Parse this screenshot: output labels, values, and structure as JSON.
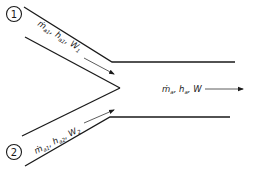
{
  "diagram": {
    "title": "",
    "type": "adiabatic mixing of two moist air streams",
    "inlets": [
      {
        "id": "inlet-1",
        "marker": "1",
        "label_parts": {
          "mdot": "ṁ",
          "mdot_sub": "a1",
          "h": "h",
          "h_sub": "a1",
          "w": "W",
          "w_sub": "1"
        }
      },
      {
        "id": "inlet-2",
        "marker": "2",
        "label_parts": {
          "mdot": "ṁ",
          "mdot_sub": "a1",
          "h": "h",
          "h_sub": "a2",
          "w": "W",
          "w_sub": "2"
        }
      }
    ],
    "outlet": {
      "id": "outlet",
      "label_parts": {
        "mdot": "ṁ",
        "mdot_sub": "a",
        "h": "h",
        "h_sub": "a",
        "w": "W"
      }
    },
    "colors": {
      "line": "#1a1a1a",
      "background": "#ffffff"
    }
  }
}
